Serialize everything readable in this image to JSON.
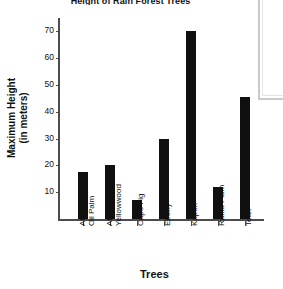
{
  "chart_data": {
    "type": "bar",
    "title": "Height of Rain Forest Trees",
    "xlabel": "Trees",
    "ylabel": "Maximum Height (in meters)",
    "ylabel_line1": "Maximum Height",
    "ylabel_line2": "(in meters)",
    "categories": [
      "African Oil Palm",
      "African Yellowwood",
      "Cape Fig",
      "Ebony",
      "Kapok",
      "Raffia Palm",
      "Teak"
    ],
    "category_lines": [
      [
        "African",
        "Oil Palm"
      ],
      [
        "African",
        "Yellowwood"
      ],
      [
        "Cape Fig"
      ],
      [
        "Ebony"
      ],
      [
        "Kapok"
      ],
      [
        "Raffia Palm"
      ],
      [
        "Teak"
      ]
    ],
    "values": [
      17.5,
      20,
      7,
      30,
      70,
      12,
      45.5
    ],
    "ylim": [
      0,
      75
    ],
    "yticks": [
      10,
      20,
      30,
      40,
      50,
      60,
      70
    ],
    "grid": false,
    "legend": false,
    "bar_color": "#101010",
    "axis_color": "#4c4c4c",
    "text_color": "#111111"
  },
  "panel": {
    "border_color": "#c9c9c9"
  }
}
